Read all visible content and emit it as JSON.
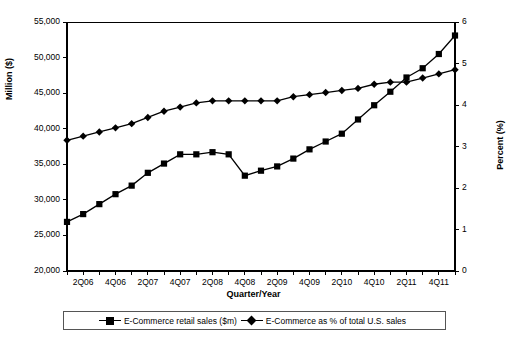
{
  "chart_data": {
    "type": "line",
    "title": "",
    "xlabel": "Quarter/Year",
    "ylabel": "Million ($)",
    "y2label": "Percent (%)",
    "grid": false,
    "legend_position": "bottom",
    "x": [
      "1Q06",
      "2Q06",
      "3Q06",
      "4Q06",
      "1Q07",
      "2Q07",
      "3Q07",
      "4Q07",
      "1Q08",
      "2Q08",
      "3Q08",
      "4Q08",
      "1Q09",
      "2Q09",
      "3Q09",
      "4Q09",
      "1Q10",
      "2Q10",
      "3Q10",
      "4Q10",
      "1Q11",
      "2Q11",
      "3Q11",
      "4Q11",
      "1Q12"
    ],
    "xtick_labels": [
      "2Q06",
      "4Q06",
      "2Q07",
      "4Q07",
      "2Q08",
      "4Q08",
      "2Q09",
      "4Q09",
      "2Q10",
      "4Q10",
      "2Q11",
      "4Q11"
    ],
    "ylim": [
      20000,
      55000
    ],
    "ytick_labels": [
      "20,000",
      "25,000",
      "30,000",
      "35,000",
      "40,000",
      "45,000",
      "50,000",
      "55,000"
    ],
    "ytick_values": [
      20000,
      25000,
      30000,
      35000,
      40000,
      45000,
      50000,
      55000
    ],
    "y2lim": [
      0,
      6
    ],
    "y2tick_labels": [
      "0",
      "1",
      "2",
      "3",
      "4",
      "5",
      "6"
    ],
    "y2tick_values": [
      0,
      1,
      2,
      3,
      4,
      5,
      6
    ],
    "series": [
      {
        "name": "E-Commerce retail sales ($m)",
        "marker": "square",
        "axis": "left",
        "color": "#000000",
        "values": [
          26900,
          28000,
          29400,
          30800,
          32000,
          33800,
          35100,
          36400,
          36400,
          36700,
          36400,
          33400,
          34100,
          34700,
          35800,
          37100,
          38200,
          39300,
          41300,
          43300,
          45200,
          47200,
          48500,
          50500,
          53100
        ]
      },
      {
        "name": "E-Commerce as % of total U.S. sales",
        "marker": "diamond",
        "axis": "right",
        "color": "#000000",
        "values": [
          3.15,
          3.25,
          3.35,
          3.45,
          3.55,
          3.7,
          3.85,
          3.95,
          4.05,
          4.1,
          4.1,
          4.1,
          4.1,
          4.1,
          4.2,
          4.25,
          4.3,
          4.35,
          4.4,
          4.5,
          4.55,
          4.55,
          4.65,
          4.75,
          4.85
        ]
      }
    ]
  },
  "legend": {
    "items": [
      {
        "label": "E-Commerce retail sales ($m)",
        "marker": "square"
      },
      {
        "label": "E-Commerce as % of total U.S. sales",
        "marker": "diamond"
      }
    ]
  }
}
